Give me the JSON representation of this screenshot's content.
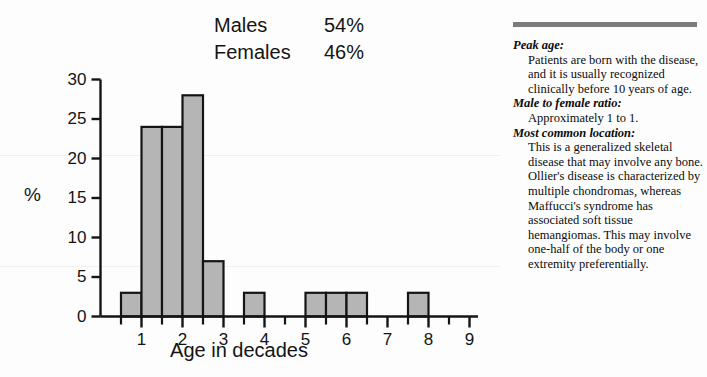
{
  "legend": {
    "rows": [
      {
        "label": "Males",
        "value": "54%"
      },
      {
        "label": "Females",
        "value": "46%"
      }
    ]
  },
  "chart_data": {
    "type": "bar",
    "title": "",
    "xlabel": "Age in decades",
    "ylabel": "%",
    "xlim": [
      0,
      9.5
    ],
    "ylim": [
      0,
      30
    ],
    "grid": false,
    "legend_position": "top-center",
    "bar_fill": "#b5b5b5",
    "bar_stroke": "#141414",
    "axis_color": "#141414",
    "bin_width": 0.5,
    "x_major_ticks": [
      1,
      2,
      3,
      4,
      5,
      6,
      7,
      8,
      9
    ],
    "x_minor_ticks": [
      0.5,
      1.5,
      2.5,
      3.5,
      4.5,
      5.5,
      6.5,
      7.5,
      8.5
    ],
    "x_tick_labels": [
      "1",
      "2",
      "3",
      "4",
      "5",
      "6",
      "7",
      "8",
      "9"
    ],
    "y_ticks": [
      0,
      5,
      10,
      15,
      20,
      25,
      30
    ],
    "y_tick_labels": [
      "0",
      "5",
      "10",
      "15",
      "20",
      "25",
      "30"
    ],
    "bins": [
      {
        "start": 0.5,
        "end": 1.0,
        "value": 3
      },
      {
        "start": 1.0,
        "end": 1.5,
        "value": 24
      },
      {
        "start": 1.5,
        "end": 2.0,
        "value": 24
      },
      {
        "start": 2.0,
        "end": 2.5,
        "value": 28
      },
      {
        "start": 2.5,
        "end": 3.0,
        "value": 7
      },
      {
        "start": 3.5,
        "end": 4.0,
        "value": 3
      },
      {
        "start": 5.0,
        "end": 5.5,
        "value": 3
      },
      {
        "start": 5.5,
        "end": 6.0,
        "value": 3
      },
      {
        "start": 6.0,
        "end": 6.5,
        "value": 3
      },
      {
        "start": 7.5,
        "end": 8.0,
        "value": 3
      }
    ],
    "categories": [
      "0.5-1",
      "1-1.5",
      "1.5-2",
      "2-2.5",
      "2.5-3",
      "3.5-4",
      "5-5.5",
      "5.5-6",
      "6-6.5",
      "7.5-8"
    ],
    "values": [
      3,
      24,
      24,
      28,
      7,
      3,
      3,
      3,
      3,
      3
    ],
    "annotations": [
      "Males 54%",
      "Females 46%"
    ]
  },
  "panel": {
    "rule_color": "#7c7c7c",
    "sections": [
      {
        "heading": "Peak age:",
        "body": "Patients are born with the disease, and it is usually recognized clinically before 10 years of age."
      },
      {
        "heading": "Male to female ratio:",
        "body": "Approximately 1 to 1."
      },
      {
        "heading": "Most common location:",
        "body": "This is a generalized skeletal disease that may involve any bone. Ollier's disease is characterized by multiple chondromas, whereas Maffucci's syndrome has associated soft tissue hemangiomas. This may involve one-half of the body or one extremity preferentially."
      }
    ]
  }
}
